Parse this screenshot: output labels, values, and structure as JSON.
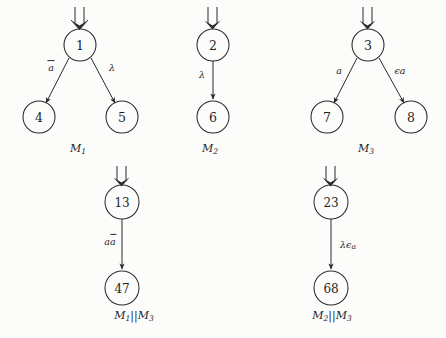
{
  "figure": {
    "kind": "labelled-transition-system-diagram",
    "background_color": "#fcfcfb",
    "ink_color": "#2b2b2b"
  },
  "machines": [
    {
      "id": "M1",
      "caption": "M",
      "caption_sub": "1",
      "caption_x": 78,
      "caption_y": 148,
      "initial_marker": "double-down-arrow",
      "states": [
        {
          "name": "1",
          "x": 80,
          "y": 45,
          "r": 16,
          "initial": true
        },
        {
          "name": "4",
          "x": 39,
          "y": 117,
          "r": 16,
          "initial": false
        },
        {
          "name": "5",
          "x": 122,
          "y": 117,
          "r": 16,
          "initial": false
        }
      ],
      "transitions": [
        {
          "from": "1",
          "to": "4",
          "label": "a",
          "label_overbar": true,
          "label_x": 50,
          "label_y": 67
        },
        {
          "from": "1",
          "to": "5",
          "label": "λ",
          "label_overbar": false,
          "label_x": 112,
          "label_y": 67
        }
      ]
    },
    {
      "id": "M2",
      "caption": "M",
      "caption_sub": "2",
      "caption_x": 213,
      "caption_y": 148,
      "initial_marker": "double-down-arrow",
      "states": [
        {
          "name": "2",
          "x": 213,
          "y": 45,
          "r": 16,
          "initial": true
        },
        {
          "name": "6",
          "x": 213,
          "y": 117,
          "r": 16,
          "initial": false
        }
      ],
      "transitions": [
        {
          "from": "2",
          "to": "6",
          "label": "λ",
          "label_overbar": false,
          "label_x": 202,
          "label_y": 74
        }
      ]
    },
    {
      "id": "M3",
      "caption": "M",
      "caption_sub": "3",
      "caption_x": 368,
      "caption_y": 148,
      "initial_marker": "double-down-arrow",
      "states": [
        {
          "name": "3",
          "x": 368,
          "y": 45,
          "r": 16,
          "initial": true
        },
        {
          "name": "7",
          "x": 327,
          "y": 117,
          "r": 16,
          "initial": false
        },
        {
          "name": "8",
          "x": 411,
          "y": 117,
          "r": 16,
          "initial": false
        }
      ],
      "transitions": [
        {
          "from": "3",
          "to": "7",
          "label": "a",
          "label_overbar": false,
          "label_x": 338,
          "label_y": 70
        },
        {
          "from": "3",
          "to": "8",
          "label": "ϵa",
          "label_overbar": false,
          "label_x": 400,
          "label_y": 70
        }
      ]
    },
    {
      "id": "M1||M3",
      "caption": "M",
      "caption_sub": "1",
      "caption_tail": "||M",
      "caption_tail_sub": "3",
      "caption_x": 134,
      "caption_y": 315,
      "initial_marker": "double-down-arrow",
      "states": [
        {
          "name": "13",
          "x": 122,
          "y": 202,
          "r": 17,
          "initial": true
        },
        {
          "name": "47",
          "x": 122,
          "y": 288,
          "r": 17,
          "initial": false
        }
      ],
      "transitions": [
        {
          "from": "13",
          "to": "47",
          "label": "aa",
          "label_overbar_second": true,
          "label_x": 110,
          "label_y": 240
        }
      ]
    },
    {
      "id": "M2||M3",
      "caption": "M",
      "caption_sub": "2",
      "caption_tail": "||M",
      "caption_tail_sub": "3",
      "caption_x": 332,
      "caption_y": 315,
      "initial_marker": "double-down-arrow",
      "states": [
        {
          "name": "23",
          "x": 331,
          "y": 202,
          "r": 17,
          "initial": true
        },
        {
          "name": "68",
          "x": 331,
          "y": 288,
          "r": 17,
          "initial": false
        }
      ],
      "transitions": [
        {
          "from": "23",
          "to": "68",
          "label": "λϵ",
          "label_sub": "a",
          "label_x": 350,
          "label_y": 244
        }
      ]
    }
  ],
  "text": {
    "node_1": "1",
    "node_2": "2",
    "node_3": "3",
    "node_4": "4",
    "node_5": "5",
    "node_6": "6",
    "node_7": "7",
    "node_8": "8",
    "node_13": "13",
    "node_23": "23",
    "node_47": "47",
    "node_68": "68",
    "m1_edge_left": "a",
    "m1_edge_right": "λ",
    "m2_edge": "λ",
    "m3_edge_left": "a",
    "m3_edge_right_eps": "ϵ",
    "m3_edge_right_a": "a",
    "comp13_edge_a": "a",
    "comp13_edge_abar": "a",
    "comp23_edge_lambda": "λ",
    "comp23_edge_eps": "ϵ",
    "comp23_edge_sub": "a",
    "caption_M": "M",
    "caption_bars": "||",
    "sub_1": "1",
    "sub_2": "2",
    "sub_3": "3"
  }
}
